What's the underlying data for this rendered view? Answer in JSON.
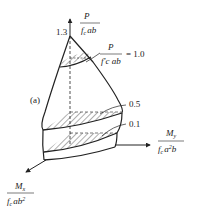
{
  "figure": {
    "panel_label": "(a)",
    "apex_value": "1.3",
    "vertical_axis": {
      "numerator": "P",
      "denominator_f": "f",
      "denominator_sub": "c",
      "denominator_rest": "ab"
    },
    "horizontal_axis": {
      "numerator": "M",
      "numerator_sub": "y",
      "denominator_f": "f",
      "denominator_sub": "c",
      "denominator_rest": "a",
      "denominator_sup": "2",
      "denominator_tail": "b"
    },
    "depth_axis": {
      "numerator": "M",
      "numerator_sub": "x",
      "denominator_f": "f",
      "denominator_sub": "c",
      "denominator_rest": "ab",
      "denominator_sup": "2"
    },
    "sections": [
      {
        "label_numerator": "P",
        "label_denominator": "f'c ab",
        "value": "= 1.0"
      },
      {
        "value": "0.5"
      },
      {
        "value": "0.1"
      }
    ],
    "colors": {
      "line": "#222222",
      "hatch": "#333333",
      "background": "#ffffff"
    }
  }
}
